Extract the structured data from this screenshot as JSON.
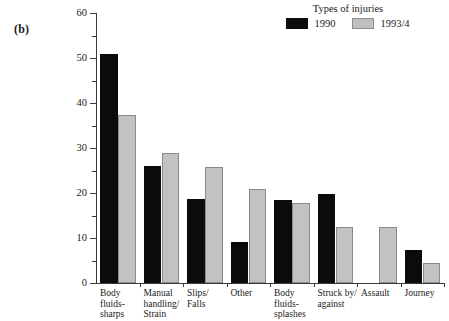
{
  "panel": {
    "label": "(b)"
  },
  "legend": {
    "title": "Types of injuries",
    "items": [
      {
        "label": "1990",
        "color": "#0b0b0b",
        "key": "v1990"
      },
      {
        "label": "1993/4",
        "color": "#c2c2c2",
        "key": "v1993"
      }
    ]
  },
  "axes": {
    "ylabel": "Rate per 1000 employees",
    "xlabel": "",
    "yticks": [
      "0",
      "10",
      "20",
      "30",
      "40",
      "50",
      "60"
    ],
    "yminor": [
      "5",
      "15",
      "25",
      "35",
      "45",
      "55"
    ]
  },
  "chart_data": {
    "type": "bar",
    "title": "",
    "subtitle": "",
    "xlabel": "",
    "ylabel": "Rate per 1000 employees",
    "ylim": [
      0,
      60
    ],
    "ytick_step": 10,
    "yminor_step": 5,
    "grid": false,
    "legend_position": "top-right",
    "legend_title": "Types of injuries",
    "categories": [
      "Body fluids-sharps",
      "Manual handling/Strain",
      "Slips/Falls",
      "Other",
      "Body fluids-splashes",
      "Struck by/against",
      "Assault",
      "Journey"
    ],
    "category_label_lines": [
      [
        "Body",
        "fluids-",
        "sharps"
      ],
      [
        "Manual",
        "handling/",
        "Strain"
      ],
      [
        "Slips/",
        "Falls"
      ],
      [
        "Other"
      ],
      [
        "Body",
        "fluids-",
        "splashes"
      ],
      [
        "Struck by/",
        "against"
      ],
      [
        "Assault"
      ],
      [
        "Journey"
      ]
    ],
    "series": [
      {
        "name": "1990",
        "color": "#0b0b0b",
        "values": [
          51.0,
          26.0,
          18.6,
          9.1,
          18.4,
          19.8,
          null,
          7.3
        ]
      },
      {
        "name": "1993/4",
        "color": "#c2c2c2",
        "values": [
          37.3,
          29.0,
          25.8,
          21.0,
          17.8,
          12.5,
          12.5,
          4.4
        ]
      }
    ]
  }
}
